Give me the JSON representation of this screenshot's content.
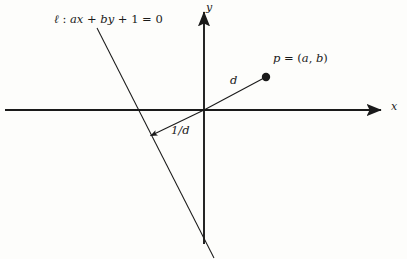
{
  "figure": {
    "background_color": "#fdfdfb",
    "stroke_color": "#1a1a1a",
    "width": 407,
    "height": 259
  },
  "axes": {
    "x_label": "x",
    "y_label": "y",
    "origin": {
      "x": 204,
      "y": 110
    },
    "x_axis": {
      "start_x": 5,
      "end_x": 385,
      "y": 110,
      "arrow": "right"
    },
    "y_axis": {
      "x": 204,
      "start_y": 8,
      "end_y": 244,
      "arrow": "up"
    }
  },
  "line": {
    "equation_label": "ℓ : ax + by + 1 = 0",
    "equation_parts": {
      "name": "ℓ",
      "colon": " : ",
      "a": "a",
      "x": "x",
      "plus1": " + ",
      "b": "b",
      "y": "y",
      "plus2": " + ",
      "one": "1",
      "equals": " = ",
      "zero": "0"
    },
    "start": {
      "x": 97,
      "y": 28
    },
    "end": {
      "x": 214,
      "y": 258
    },
    "x_intercept": 138
  },
  "point": {
    "label": "p = (a, b)",
    "label_parts": {
      "p": "p",
      "eq": " = (",
      "a": "a",
      "comma": ", ",
      "b": "b",
      "close": ")"
    },
    "position": {
      "x": 266,
      "y": 77
    },
    "dot_radius": 4.2
  },
  "segments": {
    "distance_to_point": {
      "label": "d",
      "from": {
        "x": 204,
        "y": 110
      },
      "to": {
        "x": 266,
        "y": 77
      }
    },
    "distance_to_line": {
      "label": "1/d",
      "from": {
        "x": 204,
        "y": 110
      },
      "to": {
        "x": 148,
        "y": 137
      },
      "arrow": "end"
    }
  }
}
